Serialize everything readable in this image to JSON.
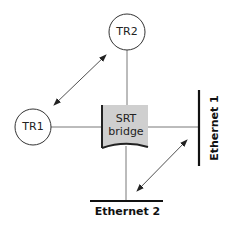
{
  "nodes": {
    "tr1": {
      "label": "TR1"
    },
    "tr2": {
      "label": "TR2"
    },
    "bridge": {
      "line1": "SRT",
      "line2": "bridge",
      "fill": "#cfcfcf"
    }
  },
  "segments": {
    "ethernet1": {
      "label": "Ethernet 1"
    },
    "ethernet2": {
      "label": "Ethernet 2"
    }
  },
  "colors": {
    "stroke": "#333333",
    "bar": "#111111"
  }
}
